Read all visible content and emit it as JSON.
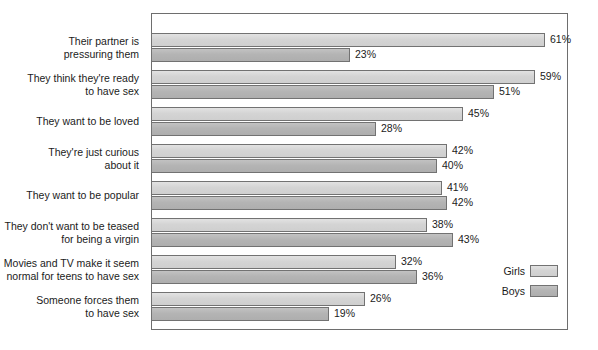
{
  "chart_data": {
    "type": "bar",
    "orientation": "horizontal",
    "title": "",
    "subtitle": "",
    "xlabel": "",
    "ylabel": "",
    "grid": false,
    "legend_position": "bottom-right",
    "value_suffix": "%",
    "categories": [
      "Their partner is\npressuring them",
      "They think they're ready\nto have sex",
      "They want to be loved",
      "They're just curious\nabout it",
      "They want to be popular",
      "They don't want to be teased\nfor being a virgin",
      "Movies and TV make it seem\nnormal for teens to have sex",
      "Someone forces them\nto have sex"
    ],
    "series": [
      {
        "name": "Girls",
        "color": "#d4d4d4",
        "values": [
          61,
          59,
          45,
          42,
          41,
          38,
          32,
          26
        ],
        "labels": [
          "61%",
          "59%",
          "45%",
          "42%",
          "41%",
          "38%",
          "32%",
          "26%"
        ]
      },
      {
        "name": "Boys",
        "color": "#b4b4b4",
        "values": [
          23,
          51,
          28,
          40,
          42,
          43,
          36,
          19
        ],
        "labels": [
          "23%",
          "51%",
          "28%",
          "40%",
          "42%",
          "43%",
          "36%",
          "19%"
        ]
      }
    ]
  },
  "legend": {
    "items": [
      {
        "label": "Girls",
        "color": "#d4d4d4"
      },
      {
        "label": "Boys",
        "color": "#b4b4b4"
      }
    ]
  },
  "frame": {
    "border_color": "#6e6e6e",
    "background": "#ffffff"
  }
}
